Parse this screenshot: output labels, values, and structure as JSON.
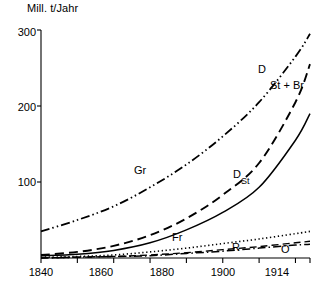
{
  "chart_data": {
    "type": "line",
    "title": "",
    "ylabel": "Mill. t/Jahr",
    "xlabel": "",
    "xlim": [
      1840,
      1914
    ],
    "ylim": [
      0,
      300
    ],
    "grid": false,
    "legend_position": "inline-labels",
    "yticks": [
      100,
      200,
      300
    ],
    "ytick_labels": [
      "100",
      "200",
      "300"
    ],
    "xticks": [
      1840,
      1860,
      1880,
      1900,
      1914
    ],
    "xtick_labels": [
      "1840",
      "1860",
      "1880",
      "1900",
      "1914"
    ],
    "x_minor_ticks": [
      1850,
      1870,
      1890,
      1910
    ],
    "x": [
      1840,
      1850,
      1860,
      1870,
      1880,
      1890,
      1900,
      1910,
      1914
    ],
    "series": [
      {
        "name": "Gr",
        "label": "Gr",
        "style": "dash-dot-dot",
        "values": [
          35,
          50,
          68,
          93,
          123,
          160,
          205,
          265,
          295
        ]
      },
      {
        "name": "D",
        "label": "D",
        "style": "dashed",
        "values": [
          4,
          8,
          16,
          30,
          52,
          83,
          125,
          205,
          255
        ]
      },
      {
        "name": "St+Br",
        "label": "St + Br",
        "style": "solid",
        "values": [
          3,
          5,
          10,
          20,
          37,
          60,
          93,
          155,
          190
        ]
      },
      {
        "name": "Fr",
        "label": "Fr",
        "style": "dotted",
        "values": [
          1,
          2,
          4,
          8,
          13,
          19,
          25,
          32,
          35
        ]
      },
      {
        "name": "R",
        "label": "R",
        "style": "dashed-thin",
        "values": [
          0,
          1,
          2,
          4,
          7,
          11,
          15,
          20,
          22
        ]
      },
      {
        "name": "O",
        "label": "O",
        "style": "dash-dot",
        "values": [
          0,
          1,
          2,
          3,
          6,
          9,
          13,
          17,
          18
        ]
      }
    ],
    "annotations": [
      {
        "text": "Gr",
        "x": 1872,
        "y": 118
      },
      {
        "text": "D",
        "x": 1907,
        "y": 238
      },
      {
        "text": "St + Br",
        "x": 1910,
        "y": 218
      },
      {
        "text": "D",
        "x": 1893,
        "y": 108
      },
      {
        "text": "St",
        "x": 1897,
        "y": 96
      },
      {
        "text": "Fr",
        "x": 1881,
        "y": 42
      },
      {
        "text": "R",
        "x": 1899,
        "y": 26
      },
      {
        "text": "O",
        "x": 1911,
        "y": 19
      }
    ]
  },
  "labels": {
    "axis_title": "Mill. t/Jahr",
    "y": {
      "t300": "300",
      "t200": "200",
      "t100": "100"
    },
    "x": {
      "t1840": "1840",
      "t1860": "1860",
      "t1880": "1880",
      "t1900": "1900",
      "t1914": "1914"
    },
    "curves": {
      "gr": "Gr",
      "d_top": "D",
      "stbr": "St + Br",
      "d_mid": "D",
      "st_mid": "St",
      "fr": "Fr",
      "r": "R",
      "o": "O"
    }
  },
  "colors": {
    "ink": "#000000",
    "background": "#ffffff"
  }
}
